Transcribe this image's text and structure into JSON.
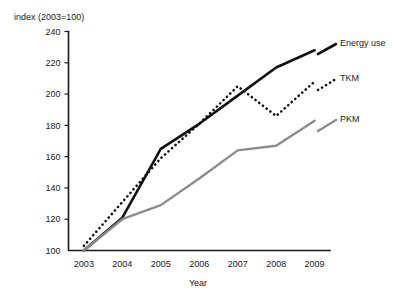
{
  "chart_data": {
    "type": "line",
    "title": "",
    "xlabel": "Year",
    "ylabel": "index (2003=100)",
    "x": [
      2003,
      2004,
      2005,
      2006,
      2007,
      2008,
      2009
    ],
    "categories": [
      "2003",
      "2004",
      "2005",
      "2006",
      "2007",
      "2008",
      "2009"
    ],
    "xlim": [
      2002.6,
      2009.4
    ],
    "ylim": [
      100,
      240
    ],
    "yticks": [
      100,
      120,
      140,
      160,
      180,
      200,
      220,
      240
    ],
    "ytick_labels": [
      "100",
      "120",
      "140",
      "160",
      "180",
      "200",
      "220",
      "240"
    ],
    "xtick_labels": [
      "2003",
      "2004",
      "2005",
      "2006",
      "2007",
      "2008",
      "2009"
    ],
    "grid": false,
    "legend_position": "right-inline-labels",
    "series": [
      {
        "name": "Energy use",
        "style": "solid",
        "color": "#111111",
        "width": 2.6,
        "values": [
          100,
          121,
          165,
          181,
          199,
          217,
          228
        ]
      },
      {
        "name": "TKM",
        "style": "dotted",
        "color": "#111111",
        "width": 2.6,
        "values": [
          103,
          131,
          159,
          181,
          205,
          186,
          208
        ]
      },
      {
        "name": "PKM",
        "style": "solid",
        "color": "#8c8c8c",
        "width": 2.4,
        "values": [
          100,
          120,
          129,
          146,
          164,
          167,
          183
        ]
      }
    ]
  },
  "legend": {
    "items": [
      {
        "label": "Energy use"
      },
      {
        "label": "TKM"
      },
      {
        "label": "PKM"
      }
    ]
  }
}
